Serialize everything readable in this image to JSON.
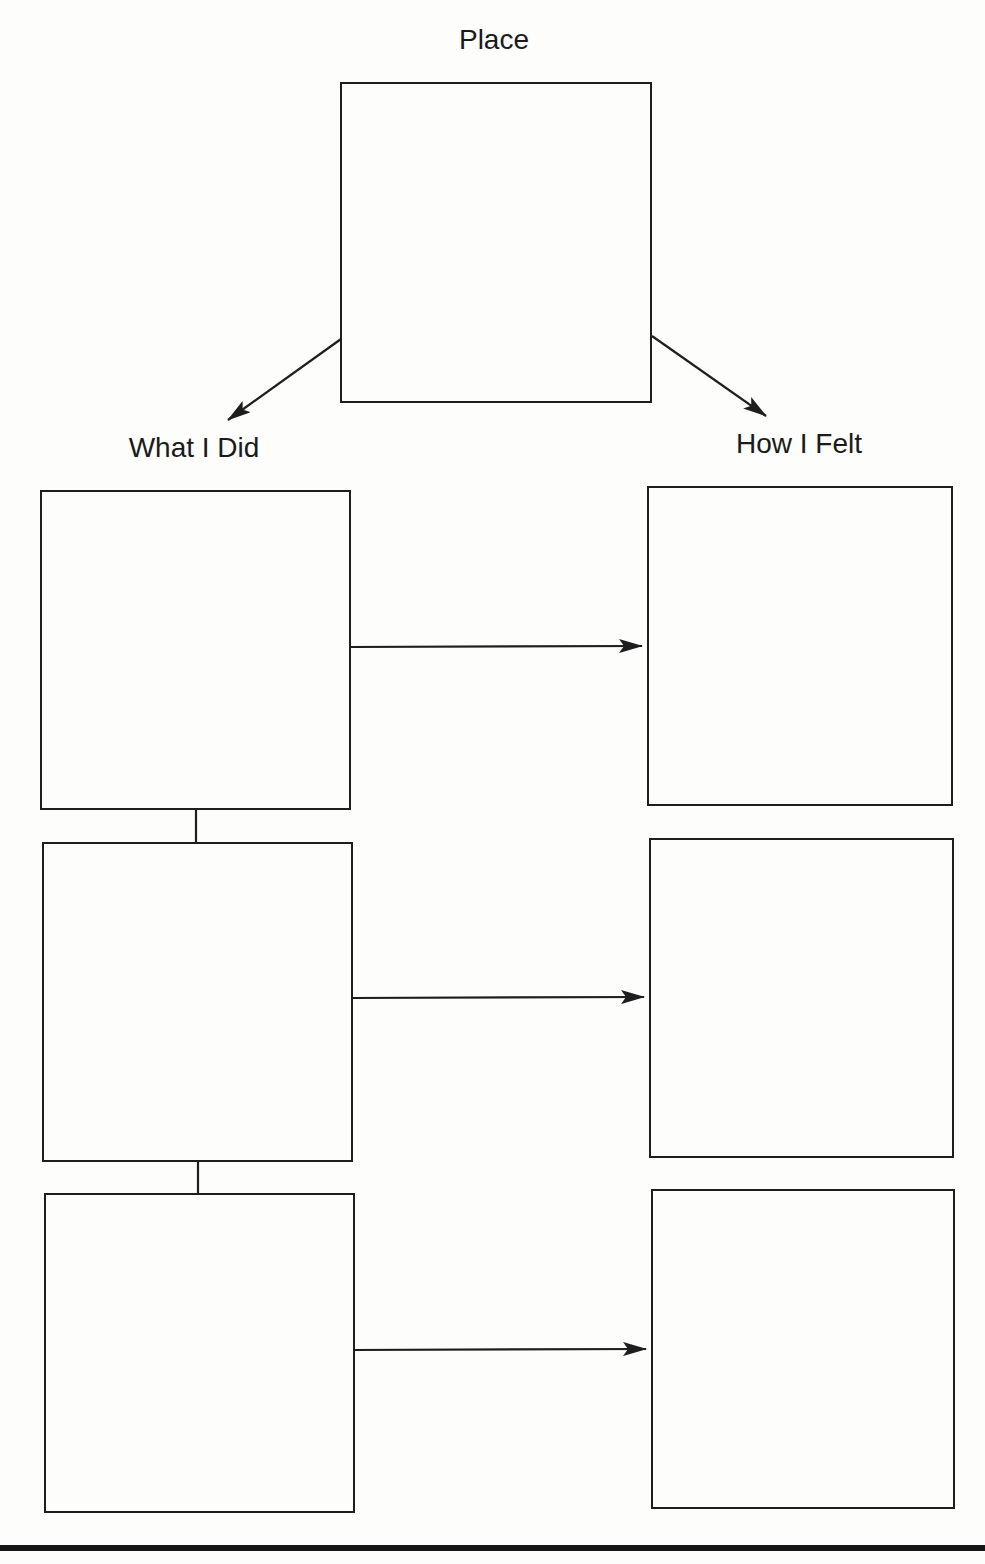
{
  "diagram": {
    "type": "graphic-organizer",
    "labels": {
      "place": "Place",
      "what_i_did": "What I Did",
      "how_i_felt": "How I Felt"
    },
    "nodes": [
      {
        "id": "place",
        "label": "Place",
        "content": ""
      },
      {
        "id": "did-1",
        "column": "What I Did",
        "content": ""
      },
      {
        "id": "did-2",
        "column": "What I Did",
        "content": ""
      },
      {
        "id": "did-3",
        "column": "What I Did",
        "content": ""
      },
      {
        "id": "felt-1",
        "column": "How I Felt",
        "content": ""
      },
      {
        "id": "felt-2",
        "column": "How I Felt",
        "content": ""
      },
      {
        "id": "felt-3",
        "column": "How I Felt",
        "content": ""
      }
    ],
    "edges": [
      {
        "from": "place",
        "to": "did-1",
        "kind": "arrow"
      },
      {
        "from": "place",
        "to": "felt-1",
        "kind": "arrow"
      },
      {
        "from": "did-1",
        "to": "felt-1",
        "kind": "arrow"
      },
      {
        "from": "did-2",
        "to": "felt-2",
        "kind": "arrow"
      },
      {
        "from": "did-3",
        "to": "felt-3",
        "kind": "arrow"
      },
      {
        "from": "did-1",
        "to": "did-2",
        "kind": "line"
      },
      {
        "from": "did-2",
        "to": "did-3",
        "kind": "line"
      }
    ],
    "colors": {
      "ink": "#1e1e1e",
      "paper": "#fdfdfc"
    }
  }
}
